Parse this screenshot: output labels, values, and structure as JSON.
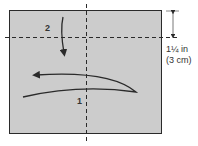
{
  "diagram": {
    "type": "folding-instruction",
    "paper_color": "#cccccc",
    "line_color": "#2a2a2a",
    "steps": [
      {
        "number": "1",
        "action": "fold right edge over to the left along vertical center line"
      },
      {
        "number": "2",
        "action": "fold top edge down along horizontal dashed line"
      }
    ],
    "dimension": {
      "line1": "1¼ in",
      "line2": "(3 cm)"
    }
  }
}
